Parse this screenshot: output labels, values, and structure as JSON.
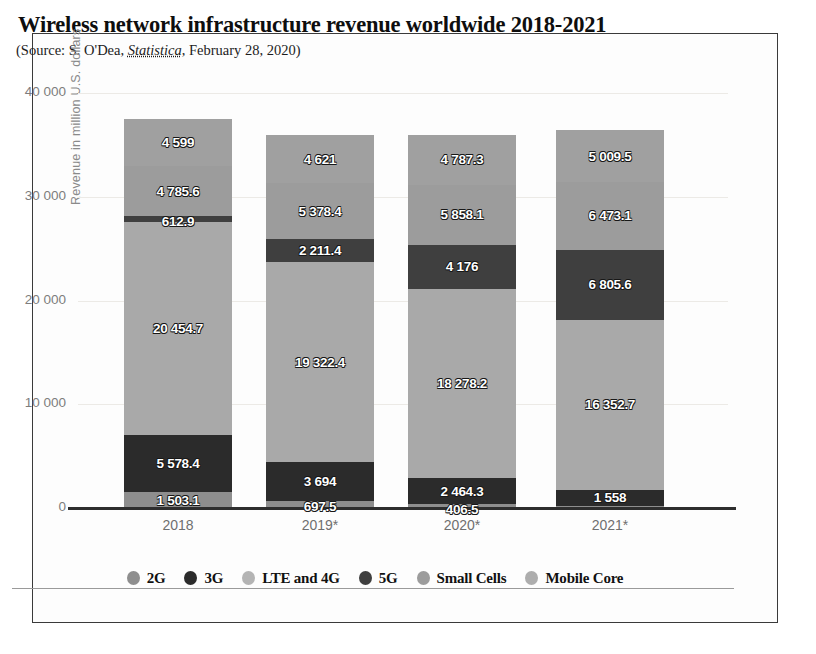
{
  "header": {
    "title": "Wireless network infrastructure revenue worldwide 2018-2021",
    "source_prefix": "(Source: S. O'Dea, ",
    "source_italic": "Statistica",
    "source_suffix": ", February 28, 2020)"
  },
  "axis": {
    "y_title": "Revenue in million U.S. dollars",
    "y_ticks": [
      "40 000",
      "30 000",
      "20 000",
      "10 000",
      "0"
    ],
    "x_ticks": [
      "2018",
      "2019*",
      "2020*",
      "2021*"
    ]
  },
  "colors": {
    "2G": "#8e8e8e",
    "3G": "#2b2b2b",
    "LTE and 4G": "#a9a9a9",
    "5G": "#3f3f3f",
    "Small Cells": "#9c9c9c",
    "Mobile Core": "#a0a0a0",
    "grid": "#eceae6",
    "axis": "#2e2e2e",
    "frame": "#3a3a3a"
  },
  "legend": {
    "items": [
      {
        "label": "2G",
        "color": "#8e8e8e"
      },
      {
        "label": "3G",
        "color": "#2b2b2b"
      },
      {
        "label": "LTE and 4G",
        "color": "#b4b4b4"
      },
      {
        "label": "5G",
        "color": "#3f3f3f"
      },
      {
        "label": "Small Cells",
        "color": "#9c9c9c"
      },
      {
        "label": "Mobile Core",
        "color": "#adadad"
      }
    ]
  },
  "chart_data": {
    "type": "bar",
    "stacked": true,
    "title": "Wireless network infrastructure revenue worldwide 2018-2021",
    "subtitle": "(Source: S. O'Dea, Statistica, February 28, 2020)",
    "xlabel": "",
    "ylabel": "Revenue in million U.S. dollars",
    "ylim": [
      0,
      40000
    ],
    "yticks": [
      0,
      10000,
      20000,
      30000,
      40000
    ],
    "grid": true,
    "legend_position": "bottom",
    "categories": [
      "2018",
      "2019*",
      "2020*",
      "2021*"
    ],
    "series": [
      {
        "name": "2G",
        "values": [
          1503.1,
          697.5,
          406.5,
          200
        ],
        "labels": [
          "1 503.1",
          "697.5",
          "406.5",
          ""
        ]
      },
      {
        "name": "3G",
        "values": [
          5578.4,
          3694,
          2464.3,
          1558
        ],
        "labels": [
          "5 578.4",
          "3 694",
          "2 464.3",
          "1 558"
        ]
      },
      {
        "name": "LTE and 4G",
        "values": [
          20454.7,
          19322.4,
          18278.2,
          16352.7
        ],
        "labels": [
          "20 454.7",
          "19 322.4",
          "18 278.2",
          "16 352.7"
        ]
      },
      {
        "name": "5G",
        "values": [
          612.9,
          2211.4,
          4176,
          6805.6
        ],
        "labels": [
          "612.9",
          "2 211.4",
          "4 176",
          "6 805.6"
        ]
      },
      {
        "name": "Small Cells",
        "values": [
          4785.6,
          5378.4,
          5858.1,
          6473.1
        ],
        "labels": [
          "4 785.6",
          "5 378.4",
          "5 858.1",
          "6 473.1"
        ]
      },
      {
        "name": "Mobile Core",
        "values": [
          4599,
          4621,
          4787.3,
          5009.5
        ],
        "labels": [
          "4 599",
          "4 621",
          "4 787.3",
          "5 009.5"
        ]
      }
    ],
    "totals": [
      37533.7,
      35924.7,
      35970.4,
      36399.0
    ]
  }
}
